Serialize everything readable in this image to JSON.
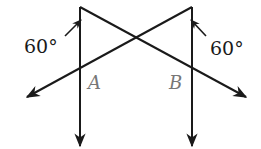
{
  "diagram": {
    "angle_left": "60°",
    "angle_right": "60°",
    "point_a": "A",
    "point_b": "B",
    "colors": {
      "stroke": "#1a1a1a",
      "point_label": "#777777"
    }
  }
}
